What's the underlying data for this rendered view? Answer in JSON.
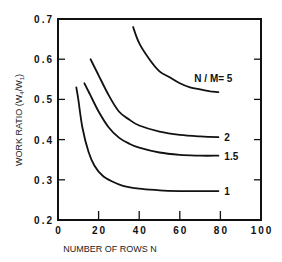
{
  "chart_data": {
    "type": "line",
    "title": "",
    "xlabel": "NUMBER OF ROWS N",
    "ylabel": "WORK RATIO (W4/W1)",
    "xlim": [
      0,
      100
    ],
    "ylim": [
      0.2,
      0.7
    ],
    "x_ticks": [
      0,
      20,
      40,
      60,
      80,
      100
    ],
    "x_tick_labels": [
      "0",
      "20",
      "40",
      "60",
      "80",
      "100"
    ],
    "y_ticks": [
      0.2,
      0.3,
      0.4,
      0.5,
      0.6,
      0.7
    ],
    "y_tick_labels": [
      "0.2",
      "0.3",
      "0.4",
      "0.5",
      "0.6",
      "0.7"
    ],
    "grid": false,
    "legend": "inline labels at right end of each curve",
    "series": [
      {
        "name": "N / M= 5",
        "label": "N / M= 5",
        "x": [
          37,
          40,
          45,
          50,
          55,
          60,
          65,
          70,
          75,
          79
        ],
        "y": [
          0.68,
          0.64,
          0.6,
          0.57,
          0.555,
          0.54,
          0.53,
          0.525,
          0.52,
          0.518
        ]
      },
      {
        "name": "2",
        "label": "2",
        "x": [
          16,
          20,
          25,
          30,
          35,
          40,
          50,
          60,
          70,
          79
        ],
        "y": [
          0.6,
          0.56,
          0.51,
          0.47,
          0.45,
          0.435,
          0.42,
          0.412,
          0.408,
          0.406
        ]
      },
      {
        "name": "1.5",
        "label": "1.5",
        "x": [
          13,
          16,
          20,
          25,
          30,
          35,
          40,
          50,
          60,
          70,
          79
        ],
        "y": [
          0.54,
          0.51,
          0.47,
          0.43,
          0.405,
          0.39,
          0.38,
          0.368,
          0.362,
          0.36,
          0.36
        ]
      },
      {
        "name": "1",
        "label": "1",
        "x": [
          9,
          10,
          12,
          15,
          18,
          22,
          27,
          32,
          40,
          50,
          60,
          70,
          79
        ],
        "y": [
          0.53,
          0.5,
          0.43,
          0.37,
          0.335,
          0.31,
          0.295,
          0.285,
          0.278,
          0.274,
          0.272,
          0.272,
          0.272
        ]
      }
    ]
  },
  "labels": {
    "xlabel": "NUMBER OF ROWS N",
    "ylabel_main": "WORK RATIO (W",
    "ylabel_sub1": "4",
    "ylabel_mid": "/W",
    "ylabel_sub2": "1",
    "ylabel_end": ")"
  }
}
